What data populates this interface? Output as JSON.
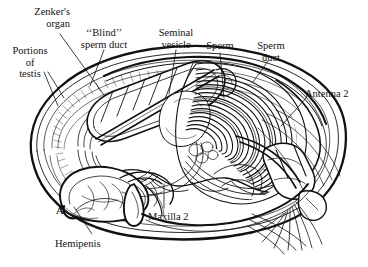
{
  "figure": {
    "kind": "scientific-illustration",
    "panel_letter": "A",
    "background_color": "#ffffff",
    "ink_color": "#111111"
  },
  "labels": [
    {
      "id": "zenkers-organ",
      "text": "Zenker's\norgan",
      "align": "right",
      "x": 18,
      "y": 6,
      "w": 52
    },
    {
      "id": "blind-sperm-duct",
      "text": "‘‘Blind’’\nsperm duct",
      "align": "center",
      "x": 70,
      "y": 27,
      "w": 68
    },
    {
      "id": "seminal-vesicle",
      "text": "Seminal\nvesicle",
      "align": "center",
      "x": 152,
      "y": 27,
      "w": 48
    },
    {
      "id": "sperm",
      "text": "Sperm",
      "align": "center",
      "x": 200,
      "y": 40,
      "w": 40
    },
    {
      "id": "sperm-duct",
      "text": "Sperm\nduct",
      "align": "center",
      "x": 250,
      "y": 40,
      "w": 42
    },
    {
      "id": "portions-of-testis",
      "text": "Portions\nof\ntestis",
      "align": "center",
      "x": 4,
      "y": 45,
      "w": 52
    },
    {
      "id": "antenna-2",
      "text": "Antenna 2",
      "align": "left",
      "x": 305,
      "y": 88,
      "w": 60
    },
    {
      "id": "panel-letter-a",
      "text": "A",
      "align": "left",
      "x": 56,
      "y": 205,
      "w": 12,
      "bold": true
    },
    {
      "id": "hemipenis",
      "text": "Hemipenis",
      "align": "left",
      "x": 55,
      "y": 238,
      "w": 64
    },
    {
      "id": "maxilla-2",
      "text": "Maxilla 2",
      "align": "left",
      "x": 148,
      "y": 211,
      "w": 58
    }
  ],
  "leader_lines": [
    {
      "id": "leader-zenkers-organ",
      "from": [
        60,
        34
      ],
      "to": [
        104,
        95
      ]
    },
    {
      "id": "leader-blind-sperm-duct",
      "from": [
        104,
        50
      ],
      "to": [
        90,
        86
      ]
    },
    {
      "id": "leader-seminal-vesicle",
      "from": [
        176,
        50
      ],
      "to": [
        169,
        94
      ]
    },
    {
      "id": "leader-sperm",
      "from": [
        220,
        53
      ],
      "to": [
        224,
        98
      ]
    },
    {
      "id": "leader-sperm-duct",
      "from": [
        268,
        61
      ],
      "to": [
        253,
        82
      ]
    },
    {
      "id": "leader-portions-testis-1",
      "from": [
        44,
        72
      ],
      "to": [
        58,
        106
      ]
    },
    {
      "id": "leader-portions-testis-2",
      "from": [
        48,
        72
      ],
      "to": [
        64,
        98
      ]
    },
    {
      "id": "leader-antenna-2",
      "from": [
        307,
        97
      ],
      "to": [
        281,
        126
      ]
    },
    {
      "id": "leader-hemipenis",
      "from": [
        92,
        234
      ],
      "to": [
        74,
        207
      ]
    },
    {
      "id": "leader-maxilla-2",
      "from": [
        164,
        208
      ],
      "to": [
        164,
        184
      ]
    }
  ],
  "structures": [
    {
      "id": "carapace-outline",
      "name": "carapace valve outline"
    },
    {
      "id": "carapace-inner-rim",
      "name": "inner carapace rim"
    },
    {
      "id": "blind-sperm-duct-body",
      "name": "segmented blind sperm duct",
      "segments": 7
    },
    {
      "id": "zenkers-organ-band",
      "name": "Zenker's organ diagonal band"
    },
    {
      "id": "sperm-mass",
      "name": "coiled sperm mass",
      "coil_count": 26
    },
    {
      "id": "seminal-vesicle-body",
      "name": "seminal vesicle"
    },
    {
      "id": "testis-loops",
      "name": "testis loops"
    },
    {
      "id": "hemipenis-body",
      "name": "hemipenis"
    },
    {
      "id": "maxilla-2-body",
      "name": "maxilla 2 appendage"
    },
    {
      "id": "antenna-2-body",
      "name": "antenna 2 with setae"
    },
    {
      "id": "egg-cluster",
      "name": "small rounded cell cluster"
    }
  ]
}
